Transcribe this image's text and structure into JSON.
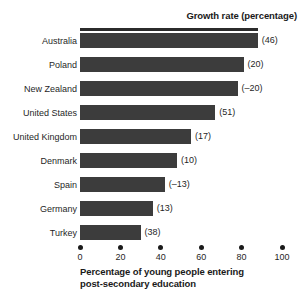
{
  "chart_data": {
    "type": "bar",
    "orientation": "horizontal",
    "title": "",
    "header_label": "Growth rate (percentage)",
    "xlabel_lines": [
      "Percentage of young people entering",
      "post-secondary education"
    ],
    "ylabel": "",
    "xlim": [
      0,
      100
    ],
    "xticks": [
      0,
      20,
      40,
      60,
      80,
      100
    ],
    "xtick_labels": [
      "0",
      "20",
      "40",
      "60",
      "80",
      "100"
    ],
    "grid": false,
    "legend": null,
    "bar_color": "#3c3c3c",
    "categories": [
      "Australia",
      "Poland",
      "New Zealand",
      "United States",
      "United Kingdom",
      "Denmark",
      "Spain",
      "Germany",
      "Turkey"
    ],
    "values": [
      88,
      81,
      78,
      67,
      55,
      48,
      42,
      36,
      30
    ],
    "annotations": [
      "(46)",
      "(20)",
      "(–20)",
      "(51)",
      "(17)",
      "(10)",
      "(–13)",
      "(13)",
      "(38)"
    ],
    "growth_rates": [
      46,
      20,
      -20,
      51,
      17,
      10,
      -13,
      13,
      38
    ],
    "rows": [
      {
        "category": "Australia",
        "value": 88,
        "annotation": "(46)"
      },
      {
        "category": "Poland",
        "value": 81,
        "annotation": "(20)"
      },
      {
        "category": "New Zealand",
        "value": 78,
        "annotation": "(–20)"
      },
      {
        "category": "United States",
        "value": 67,
        "annotation": "(51)"
      },
      {
        "category": "United Kingdom",
        "value": 55,
        "annotation": "(17)"
      },
      {
        "category": "Denmark",
        "value": 48,
        "annotation": "(10)"
      },
      {
        "category": "Spain",
        "value": 42,
        "annotation": "(–13)"
      },
      {
        "category": "Germany",
        "value": 36,
        "annotation": "(13)"
      },
      {
        "category": "Turkey",
        "value": 30,
        "annotation": "(38)"
      }
    ]
  }
}
